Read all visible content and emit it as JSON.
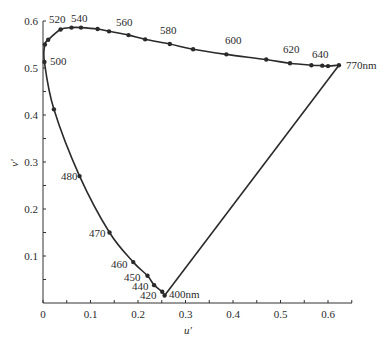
{
  "chart_data": {
    "type": "line",
    "title": "",
    "xlabel": "u'",
    "ylabel": "v'",
    "xlim": [
      0,
      0.65
    ],
    "ylim": [
      0,
      0.6
    ],
    "xticks": [
      "0",
      "0.1",
      "0.2",
      "0.3",
      "0.4",
      "0.5",
      "0.6"
    ],
    "yticks": [
      "0.1",
      "0.2",
      "0.3",
      "0.4",
      "0.5",
      "0.6"
    ],
    "grid": false,
    "legend": null,
    "series": [
      {
        "name": "spectral locus",
        "points": [
          {
            "nm": 400,
            "u": 0.256,
            "v": 0.016
          },
          {
            "nm": 420,
            "u": 0.251,
            "v": 0.024
          },
          {
            "nm": 440,
            "u": 0.234,
            "v": 0.038
          },
          {
            "nm": 450,
            "u": 0.22,
            "v": 0.058
          },
          {
            "nm": 460,
            "u": 0.19,
            "v": 0.087
          },
          {
            "nm": 470,
            "u": 0.14,
            "v": 0.15
          },
          {
            "nm": 480,
            "u": 0.077,
            "v": 0.27
          },
          {
            "nm": 490,
            "u": 0.023,
            "v": 0.412
          },
          {
            "nm": 500,
            "u": 0.003,
            "v": 0.513
          },
          {
            "nm": 505,
            "u": 0.004,
            "v": 0.55
          },
          {
            "nm": 510,
            "u": 0.011,
            "v": 0.56
          },
          {
            "nm": 520,
            "u": 0.037,
            "v": 0.582
          },
          {
            "nm": 530,
            "u": 0.06,
            "v": 0.586
          },
          {
            "nm": 540,
            "u": 0.08,
            "v": 0.586
          },
          {
            "nm": 550,
            "u": 0.115,
            "v": 0.583
          },
          {
            "nm": 560,
            "u": 0.139,
            "v": 0.578
          },
          {
            "nm": 570,
            "u": 0.18,
            "v": 0.57
          },
          {
            "nm": 580,
            "u": 0.215,
            "v": 0.561
          },
          {
            "nm": 590,
            "u": 0.267,
            "v": 0.551
          },
          {
            "nm": 600,
            "u": 0.316,
            "v": 0.54
          },
          {
            "nm": 610,
            "u": 0.386,
            "v": 0.529
          },
          {
            "nm": 620,
            "u": 0.47,
            "v": 0.518
          },
          {
            "nm": 630,
            "u": 0.52,
            "v": 0.51
          },
          {
            "nm": 640,
            "u": 0.565,
            "v": 0.506
          },
          {
            "nm": 650,
            "u": 0.588,
            "v": 0.505
          },
          {
            "nm": 660,
            "u": 0.6,
            "v": 0.504
          },
          {
            "nm": 770,
            "u": 0.623,
            "v": 0.506
          }
        ]
      },
      {
        "name": "purple line",
        "points": [
          {
            "nm": 770,
            "u": 0.623,
            "v": 0.506
          },
          {
            "nm": 400,
            "u": 0.256,
            "v": 0.016
          }
        ]
      }
    ],
    "annotations": [
      {
        "text": "400nm",
        "nm": 400
      },
      {
        "text": "420",
        "nm": 420
      },
      {
        "text": "440",
        "nm": 440
      },
      {
        "text": "450",
        "nm": 450
      },
      {
        "text": "460",
        "nm": 460
      },
      {
        "text": "470",
        "nm": 470
      },
      {
        "text": "480",
        "nm": 480
      },
      {
        "text": "500",
        "nm": 500
      },
      {
        "text": "520",
        "nm": 520
      },
      {
        "text": "540",
        "nm": 540
      },
      {
        "text": "560",
        "nm": 560
      },
      {
        "text": "580",
        "nm": 580
      },
      {
        "text": "600",
        "nm": 600
      },
      {
        "text": "620",
        "nm": 620
      },
      {
        "text": "640",
        "nm": 640
      },
      {
        "text": "770nm",
        "nm": 770
      }
    ]
  },
  "labels": {
    "x_axis_title": "u'",
    "y_axis_title": "v'",
    "xtick_0": "0",
    "xtick_1": "0.1",
    "xtick_2": "0.2",
    "xtick_3": "0.3",
    "xtick_4": "0.4",
    "xtick_5": "0.5",
    "xtick_6": "0.6",
    "ytick_1": "0.1",
    "ytick_2": "0.2",
    "ytick_3": "0.3",
    "ytick_4": "0.4",
    "ytick_5": "0.5",
    "ytick_6": "0.6",
    "wl_400": "400nm",
    "wl_420": "420",
    "wl_440": "440",
    "wl_450": "450",
    "wl_460": "460",
    "wl_470": "470",
    "wl_480": "480",
    "wl_500": "500",
    "wl_520": "520",
    "wl_540": "540",
    "wl_560": "560",
    "wl_580": "580",
    "wl_600": "600",
    "wl_620": "620",
    "wl_640": "640",
    "wl_770": "770nm"
  },
  "colors": {
    "line": "#2a2a2a",
    "background": "#ffffff"
  }
}
